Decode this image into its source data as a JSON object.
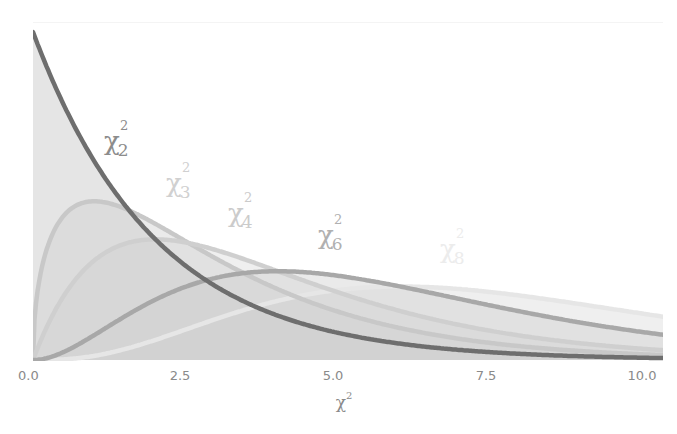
{
  "chart_data": {
    "type": "area",
    "title": "",
    "xlabel": "χ²",
    "ylabel": "",
    "xlim": [
      0,
      10.3
    ],
    "ylim": [
      0,
      0.5
    ],
    "grid": false,
    "legend_position": "inline labels",
    "x_ticks": [
      "0.0",
      "2.5",
      "5.0",
      "7.5",
      "10.0"
    ],
    "x": [
      0,
      0.5,
      1,
      1.5,
      2,
      2.5,
      3,
      3.5,
      4,
      4.5,
      5,
      5.5,
      6,
      6.5,
      7,
      7.5,
      8,
      8.5,
      9,
      9.5,
      10
    ],
    "series": [
      {
        "name": "χ²₂",
        "df": 2,
        "color": "#6e6e6e",
        "label_color": "#8c8c8c",
        "values": [
          0.5,
          0.389,
          0.303,
          0.236,
          0.184,
          0.143,
          0.112,
          0.087,
          0.068,
          0.053,
          0.041,
          0.032,
          0.025,
          0.019,
          0.015,
          0.012,
          0.009,
          0.007,
          0.006,
          0.004,
          0.003
        ]
      },
      {
        "name": "χ²₃",
        "df": 3,
        "color": "#c8c8c8",
        "label_color": "#d2d2d2",
        "values": [
          0,
          0.22,
          0.242,
          0.231,
          0.208,
          0.18,
          0.154,
          0.13,
          0.108,
          0.09,
          0.073,
          0.06,
          0.049,
          0.039,
          0.032,
          0.026,
          0.021,
          0.016,
          0.013,
          0.011,
          0.008
        ]
      },
      {
        "name": "χ²₄",
        "df": 4,
        "color": "#cfcfcf",
        "label_color": "#cdcdcd",
        "values": [
          0,
          0.097,
          0.152,
          0.177,
          0.184,
          0.179,
          0.167,
          0.152,
          0.135,
          0.119,
          0.103,
          0.088,
          0.075,
          0.063,
          0.053,
          0.044,
          0.037,
          0.03,
          0.025,
          0.021,
          0.017
        ]
      },
      {
        "name": "χ²₆",
        "df": 6,
        "color": "#a8a8a8",
        "label_color": "#b0b0b0",
        "values": [
          0,
          0.012,
          0.038,
          0.066,
          0.092,
          0.112,
          0.126,
          0.133,
          0.135,
          0.134,
          0.128,
          0.121,
          0.112,
          0.102,
          0.092,
          0.083,
          0.073,
          0.064,
          0.056,
          0.049,
          0.042
        ]
      },
      {
        "name": "χ²₈",
        "df": 8,
        "color": "#e6e6e6",
        "label_color": "#ececec",
        "values": [
          0,
          0.001,
          0.006,
          0.017,
          0.031,
          0.047,
          0.063,
          0.078,
          0.09,
          0.099,
          0.107,
          0.111,
          0.112,
          0.111,
          0.107,
          0.103,
          0.098,
          0.091,
          0.084,
          0.077,
          0.07
        ]
      }
    ]
  },
  "labels": {
    "k2": {
      "chi": "χ",
      "sub": "2",
      "sup": "2"
    },
    "k3": {
      "chi": "χ",
      "sub": "3",
      "sup": "2"
    },
    "k4": {
      "chi": "χ",
      "sub": "4",
      "sup": "2"
    },
    "k6": {
      "chi": "χ",
      "sub": "6",
      "sup": "2"
    },
    "k8": {
      "chi": "χ",
      "sub": "8",
      "sup": "2"
    }
  },
  "axis": {
    "ticks": [
      {
        "label": "0.0",
        "value": 0
      },
      {
        "label": "2.5",
        "value": 2.5
      },
      {
        "label": "5.0",
        "value": 5
      },
      {
        "label": "7.5",
        "value": 7.5
      },
      {
        "label": "10.0",
        "value": 10
      }
    ],
    "title_base": "χ",
    "title_sup": "2"
  },
  "colors": {
    "fill": "#d0d0d0",
    "tick_text": "#8a8a8a"
  }
}
